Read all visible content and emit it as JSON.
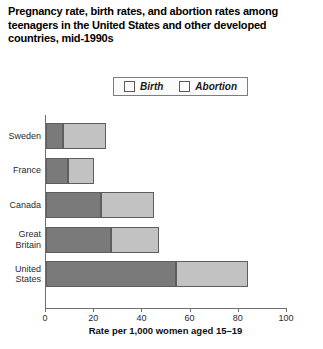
{
  "chart_data": {
    "type": "bar",
    "orientation": "horizontal",
    "stacked": true,
    "title": "Pregnancy rate, birth rates, and abortion rates among teenagers in the United States and other developed countries, mid-1990s",
    "xlabel": "Rate per 1,000 women aged 15–19",
    "ylabel": "",
    "xlim": [
      0,
      100
    ],
    "xticks": [
      0,
      20,
      40,
      60,
      80,
      100
    ],
    "xtick_labels": [
      "0",
      "20",
      "40",
      "60",
      "80",
      "100"
    ],
    "grid": false,
    "legend_position": "top",
    "categories": [
      "Sweden",
      "France",
      "Canada",
      "Great Britain",
      "United States"
    ],
    "category_lines": [
      [
        "Sweden"
      ],
      [
        "France"
      ],
      [
        "Canada"
      ],
      [
        "Great",
        "Britain"
      ],
      [
        "United",
        "States"
      ]
    ],
    "series": [
      {
        "name": "Birth",
        "color": "#7a7a7a",
        "values": [
          7,
          9,
          23,
          27,
          54
        ]
      },
      {
        "name": "Abortion",
        "color": "#c2c2c2",
        "values": [
          18,
          11,
          22,
          20,
          30
        ]
      }
    ],
    "totals": [
      25,
      20,
      45,
      47,
      84
    ]
  },
  "legend": {
    "items": [
      {
        "label": "Birth",
        "swatch": "dark-gray-swatch"
      },
      {
        "label": "Abortion",
        "swatch": "light-gray-swatch"
      }
    ]
  },
  "axis": {
    "x_title": "Rate per 1,000 women aged 15–19",
    "tick_labels": [
      "0",
      "20",
      "40",
      "60",
      "80",
      "100"
    ]
  },
  "title": {
    "text": "Pregnancy rate, birth rates, and abortion rates among teenagers in the United States and other developed countries, mid-1990s"
  }
}
